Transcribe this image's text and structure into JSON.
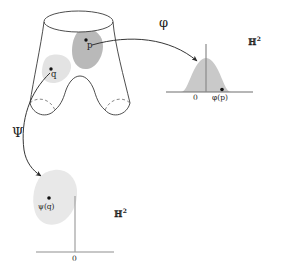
{
  "figure": {
    "surface": {
      "name": "pair-of-pants-surface",
      "points": [
        {
          "id": "p",
          "label": "p",
          "x": 89,
          "y": 41
        },
        {
          "id": "q",
          "label": "q",
          "x": 54,
          "y": 72
        }
      ],
      "patches": [
        {
          "id": "patch-p",
          "around": "p",
          "color": "#b5b5b5"
        },
        {
          "id": "patch-q",
          "around": "q",
          "color": "#e2e2e2"
        }
      ]
    },
    "maps": [
      {
        "id": "phi",
        "label": "φ",
        "from": "p",
        "to": "phi-of-p",
        "label_x": 162,
        "label_y": 22
      },
      {
        "id": "psi",
        "label": "Ψ",
        "from": "q",
        "to": "psi-of-q",
        "label_x": 15,
        "label_y": 132
      }
    ],
    "targets": [
      {
        "id": "target-upper-right",
        "space_label": "ℍ",
        "space_exponent": "2",
        "space_x": 250,
        "space_y": 41,
        "origin_label": "0",
        "origin_x": 196,
        "origin_y": 94,
        "image_label": "φ(p)",
        "image_x": 214,
        "image_y": 94,
        "patch_color": "#c9c9c9",
        "axis_color": "#6e6e6e"
      },
      {
        "id": "target-lower-left",
        "space_label": "ℍ",
        "space_exponent": "2",
        "space_x": 117,
        "space_y": 213,
        "origin_label": "0",
        "origin_x": 72,
        "origin_y": 258,
        "image_label": "ψ(q)",
        "image_x": 41,
        "image_y": 208,
        "patch_color": "#e8e8e8",
        "axis_color": "#8f8f8f"
      }
    ],
    "colors": {
      "stroke": "#3a3a3a",
      "dashed": "#6a6a6a",
      "arrow": "#2b2b2b",
      "text": "#1c1c1c",
      "patch_dark": "#b5b5b5",
      "patch_light": "#e2e2e2",
      "bell_fill": "#c9c9c9",
      "blob_fill": "#e8e8e8",
      "axis_upper": "#6e6e6e",
      "axis_lower": "#8f8f8f",
      "background": "#ffffff"
    }
  }
}
